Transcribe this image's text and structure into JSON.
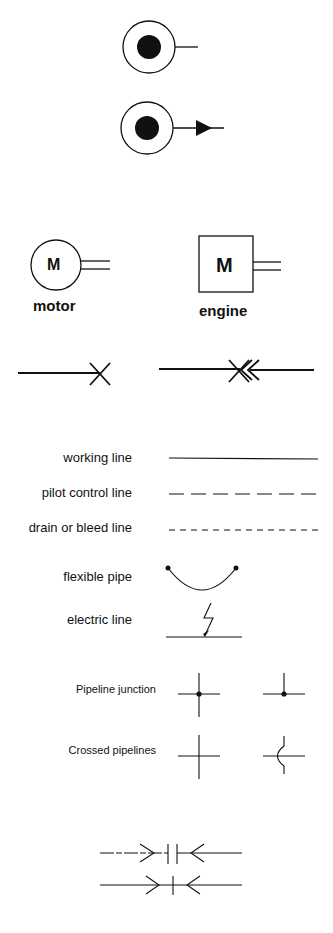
{
  "diagram": {
    "type": "hydraulic-symbols-legend",
    "symbols": {
      "rotary_output_plain": {
        "icon": "rotary-shaft-icon"
      },
      "rotary_output_arrow": {
        "icon": "rotary-shaft-arrow-icon"
      },
      "motor": {
        "glyph": "M",
        "label": "motor"
      },
      "engine": {
        "glyph": "M",
        "label": "engine"
      },
      "plugged_port": {
        "icon": "plugged-port-icon"
      },
      "quick_coupling_plugged": {
        "icon": "quick-coupling-plugged-icon"
      }
    },
    "line_types": [
      {
        "label": "working line",
        "style": "solid"
      },
      {
        "label": "pilot control line",
        "style": "long-dash"
      },
      {
        "label": "drain or bleed line",
        "style": "short-dash"
      },
      {
        "label": "flexible pipe",
        "style": "arc"
      },
      {
        "label": "electric line",
        "style": "lightning"
      }
    ],
    "pipelines": [
      {
        "label": "Pipeline junction",
        "variants": [
          "cross-junction",
          "tee-junction"
        ]
      },
      {
        "label": "Crossed pipelines",
        "variants": [
          "plain-cross",
          "hop-over-cross"
        ]
      }
    ],
    "couplings": [
      {
        "icon": "quick-coupling-disconnected-icon"
      },
      {
        "icon": "quick-coupling-connected-icon"
      }
    ],
    "colors": {
      "ink": "#111111",
      "background": "#ffffff"
    }
  }
}
